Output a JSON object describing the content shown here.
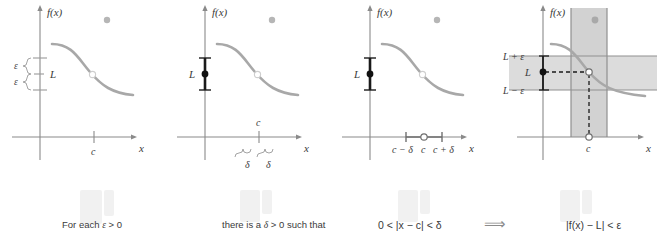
{
  "figure": {
    "kind": "epsilon-delta-limit-definition",
    "panel_count": 4,
    "curve_color": "#a8a8a8",
    "axis_color": "#8a8a8a",
    "label_color": "#3a3a3a",
    "band_fill": "#dcdcdc",
    "accent_dark": "#1a1a1a"
  },
  "panels": [
    {
      "id": "panel-1",
      "yaxis_label": "f(x)",
      "xaxis_label": "x",
      "limit_label": "L",
      "eps_upper_label": "ε",
      "eps_lower_label": "ε",
      "c_label": "c"
    },
    {
      "id": "panel-2",
      "yaxis_label": "f(x)",
      "xaxis_label": "x",
      "limit_label": "L",
      "c_label": "c",
      "delta_left_label": "δ",
      "delta_right_label": "δ"
    },
    {
      "id": "panel-3",
      "yaxis_label": "f(x)",
      "xaxis_label": "x",
      "limit_label": "L",
      "c_minus_delta_label": "c − δ",
      "c_label": "c",
      "c_plus_delta_label": "c + δ"
    },
    {
      "id": "panel-4",
      "yaxis_label": "f(x)",
      "xaxis_label": "x",
      "l_plus_eps_label": "L + ε",
      "limit_label": "L",
      "l_minus_eps_label": "L − ε",
      "c_label": "c"
    }
  ],
  "caption": {
    "part1_prefix": "For each ",
    "part1_symbol": "ε",
    "part1_suffix": " > 0",
    "part2_prefix": "there is a  ",
    "part2_symbol": "δ",
    "part2_suffix": " > 0 such that",
    "part3": "0 < |x − c| < δ",
    "arrow": "⟹",
    "part4": "|f(x) − L| < ε"
  }
}
